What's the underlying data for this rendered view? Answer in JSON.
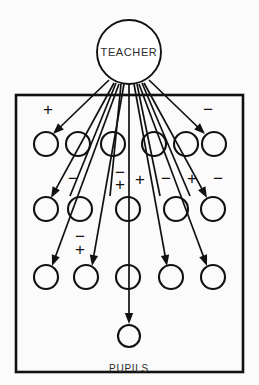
{
  "figure": {
    "background_color": "#fbfbfb",
    "ink_color": "#111111",
    "teacher": {
      "label": "TEACHER",
      "cx": 129,
      "cy": 52,
      "r": 32
    },
    "caption": {
      "label": "PUPILS",
      "x": 129,
      "y": 372
    },
    "frame": {
      "x": 16,
      "y": 95,
      "width": 227,
      "height": 277
    },
    "pupil_rows": [
      {
        "row": 1,
        "cy": 144,
        "r": 12,
        "cx": [
          46,
          78,
          113,
          154,
          186,
          214
        ]
      },
      {
        "row": 2,
        "cy": 209,
        "r": 12,
        "cx": [
          46,
          80,
          128,
          176,
          213
        ]
      },
      {
        "row": 3,
        "cy": 277,
        "r": 12,
        "cx": [
          46,
          86,
          128,
          171,
          213
        ]
      },
      {
        "row": 4,
        "cy": 336,
        "r": 11,
        "cx": [
          129
        ]
      }
    ],
    "signs": [
      {
        "id": "sign-top-left",
        "text": "+",
        "x": 48,
        "y": 111
      },
      {
        "id": "sign-top-right",
        "text": "−",
        "x": 208,
        "y": 111
      },
      {
        "id": "sign-row2-a",
        "text": "−",
        "x": 73,
        "y": 180
      },
      {
        "id": "sign-row2-b-minus",
        "text": "−",
        "x": 120,
        "y": 174
      },
      {
        "id": "sign-row2-b-plus",
        "text": "+",
        "x": 120,
        "y": 186
      },
      {
        "id": "sign-row2-c",
        "text": "+",
        "x": 140,
        "y": 181
      },
      {
        "id": "sign-row2-d",
        "text": "−",
        "x": 166,
        "y": 180
      },
      {
        "id": "sign-row2-e",
        "text": "+",
        "x": 192,
        "y": 180
      },
      {
        "id": "sign-row2-f",
        "text": "−",
        "x": 218,
        "y": 180
      },
      {
        "id": "sign-row3-a-minus",
        "text": "−",
        "x": 80,
        "y": 238
      },
      {
        "id": "sign-row3-a-plus",
        "text": "+",
        "x": 80,
        "y": 251
      }
    ],
    "arrows": [
      {
        "id": "arrow-1",
        "x1": 109,
        "y1": 80,
        "x2": 53,
        "y2": 134
      },
      {
        "id": "arrow-2",
        "x1": 114,
        "y1": 83,
        "x2": 51,
        "y2": 198
      },
      {
        "id": "arrow-3",
        "x1": 119,
        "y1": 84,
        "x2": 52,
        "y2": 266
      },
      {
        "id": "arrow-4",
        "x1": 124,
        "y1": 84,
        "x2": 92,
        "y2": 266
      },
      {
        "id": "arrow-5",
        "x1": 129,
        "y1": 84,
        "x2": 129,
        "y2": 324
      },
      {
        "id": "arrow-6",
        "x1": 134,
        "y1": 84,
        "x2": 167,
        "y2": 266
      },
      {
        "id": "arrow-7",
        "x1": 139,
        "y1": 84,
        "x2": 207,
        "y2": 266
      },
      {
        "id": "arrow-8",
        "x1": 144,
        "y1": 83,
        "x2": 207,
        "y2": 198
      },
      {
        "id": "arrow-9",
        "x1": 149,
        "y1": 80,
        "x2": 205,
        "y2": 134
      },
      {
        "id": "arrow-10",
        "x1": 121,
        "y1": 84,
        "x2": 110,
        "y2": 196,
        "headless": true
      },
      {
        "id": "arrow-11",
        "x1": 137,
        "y1": 84,
        "x2": 160,
        "y2": 196,
        "headless": true
      },
      {
        "id": "arrow-12",
        "x1": 116,
        "y1": 83,
        "x2": 70,
        "y2": 196,
        "headless": true
      },
      {
        "id": "arrow-13",
        "x1": 142,
        "y1": 83,
        "x2": 190,
        "y2": 196,
        "headless": true
      }
    ]
  }
}
